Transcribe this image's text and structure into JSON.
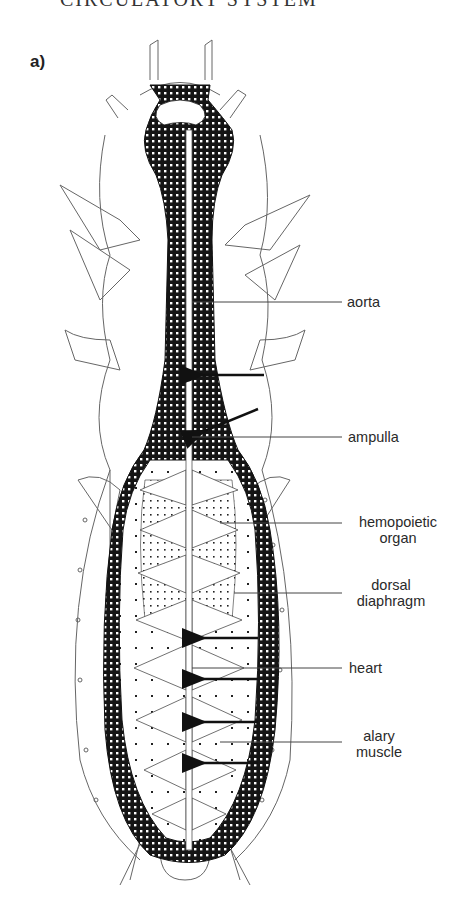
{
  "header": {
    "running_title": "CIRCULATORY SYSTEM"
  },
  "figure": {
    "panel_label": "a)",
    "labels": {
      "aorta": "aorta",
      "ampulla": "ampulla",
      "hemopoietic_1": "hemopoietic",
      "hemopoietic_2": "organ",
      "dorsal_1": "dorsal",
      "dorsal_2": "diaphragm",
      "heart": "heart",
      "alary_1": "alary",
      "alary_2": "muscle"
    },
    "colors": {
      "ink": "#111111",
      "line": "#555555",
      "fat_body": "#151515"
    }
  }
}
